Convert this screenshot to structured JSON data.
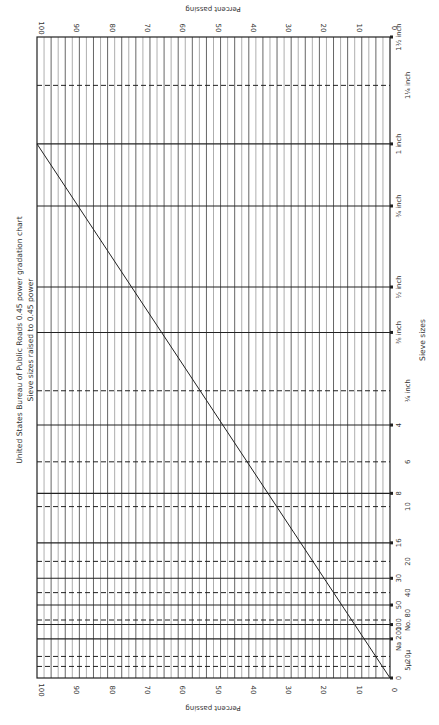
{
  "chart_data": {
    "type": "line",
    "title": "United States Bureau of Public Roads 0.45 power gradation chart",
    "subtitle": "Sieve sizes raised to 0.45 power",
    "xlabel": "Sieve sizes",
    "ylabel": "Percent passing",
    "orientation": "rotated 90 degrees clockwise (sieve axis vertical on right, percent axis horizontal)",
    "ylim": [
      0,
      100
    ],
    "y_ticks": [
      0,
      10,
      20,
      30,
      40,
      50,
      60,
      70,
      80,
      90,
      100
    ],
    "grid": "vertical lines every 2 percent",
    "sieves": [
      {
        "label": "1½ inch",
        "size_mm": 37.5,
        "style": "solid"
      },
      {
        "label": "1¼ inch",
        "size_mm": 31.5,
        "style": "dashed"
      },
      {
        "label": "1 inch",
        "size_mm": 25.0,
        "style": "solid"
      },
      {
        "label": "¾ inch",
        "size_mm": 19.0,
        "style": "solid"
      },
      {
        "label": "½ inch",
        "size_mm": 12.5,
        "style": "solid"
      },
      {
        "label": "⅜ inch",
        "size_mm": 9.5,
        "style": "solid"
      },
      {
        "label": "¼ inch",
        "size_mm": 6.3,
        "style": "dashed"
      },
      {
        "label": "4",
        "size_mm": 4.75,
        "style": "solid"
      },
      {
        "label": "6",
        "size_mm": 3.35,
        "style": "dashed"
      },
      {
        "label": "8",
        "size_mm": 2.36,
        "style": "solid"
      },
      {
        "label": "10",
        "size_mm": 2.0,
        "style": "dashed"
      },
      {
        "label": "16",
        "size_mm": 1.18,
        "style": "solid"
      },
      {
        "label": "20",
        "size_mm": 0.85,
        "style": "dashed"
      },
      {
        "label": "30",
        "size_mm": 0.6,
        "style": "solid"
      },
      {
        "label": "40",
        "size_mm": 0.425,
        "style": "dashed"
      },
      {
        "label": "50",
        "size_mm": 0.3,
        "style": "solid"
      },
      {
        "label": "No. 80",
        "size_mm": 0.18,
        "style": "dashed"
      },
      {
        "label": "100",
        "size_mm": 0.15,
        "style": "solid"
      },
      {
        "label": "Na 200",
        "size_mm": 0.075,
        "style": "solid"
      },
      {
        "label": "20μ",
        "size_mm": 0.02,
        "style": "dashed"
      },
      {
        "label": "5μ",
        "size_mm": 0.005,
        "style": "dashed"
      },
      {
        "label": "0",
        "size_mm": 0,
        "style": "solid"
      }
    ],
    "series": [
      {
        "name": "Maximum density line",
        "points": [
          {
            "sieve": "0",
            "percent": 0
          },
          {
            "sieve": "1 inch",
            "percent": 100
          }
        ]
      }
    ]
  },
  "labels": {
    "title": "United States Bureau of Public Roads 0.45 power gradation chart",
    "subtitle": "Sieve sizes raised to 0.45 power",
    "sieve_axis": "Sieve sizes",
    "percent_axis_top": "Percent passing",
    "percent_axis_bottom": "Percent passing"
  }
}
